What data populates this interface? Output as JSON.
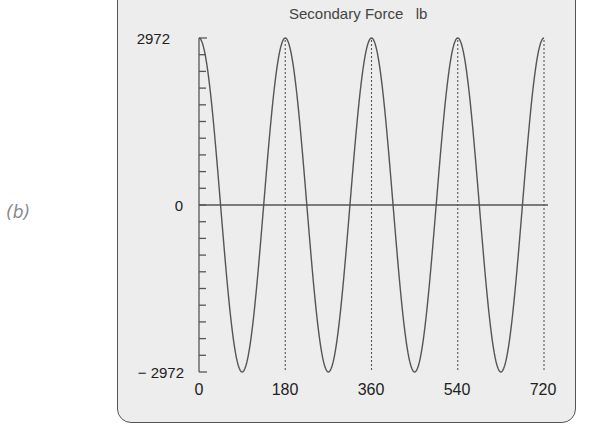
{
  "figure": {
    "sub_label": "(b)",
    "title": "Secondary Force   lb",
    "y_tick_labels": [
      "2972",
      "0",
      "− 2972"
    ],
    "x_tick_labels": [
      "0",
      "180",
      "360",
      "540",
      "720"
    ]
  },
  "colors": {
    "panel_bg": "#ededed",
    "curve": "#555555",
    "axis": "#555555",
    "text": "#222222"
  },
  "chart_data": {
    "type": "line",
    "title": "Secondary Force lb",
    "xlabel": "",
    "ylabel": "",
    "xlim": [
      0,
      720
    ],
    "ylim": [
      -2972,
      2972
    ],
    "x_ticks": [
      0,
      180,
      360,
      540,
      720
    ],
    "y_ticks_labeled": [
      2972,
      0,
      -2972
    ],
    "y_minor_ticks": 20,
    "grid": false,
    "vertical_dotted_lines_at": [
      180,
      360,
      540,
      720
    ],
    "horizontal_zero_line": true,
    "series": [
      {
        "name": "Secondary Force",
        "function": "2972 * cos(2 * theta_deg)",
        "x": [
          0,
          45,
          90,
          135,
          180,
          225,
          270,
          315,
          360,
          405,
          450,
          495,
          540,
          585,
          630,
          675,
          720
        ],
        "values": [
          2972,
          0,
          -2972,
          0,
          2972,
          0,
          -2972,
          0,
          2972,
          0,
          -2972,
          0,
          2972,
          0,
          -2972,
          0,
          2972
        ]
      }
    ]
  }
}
